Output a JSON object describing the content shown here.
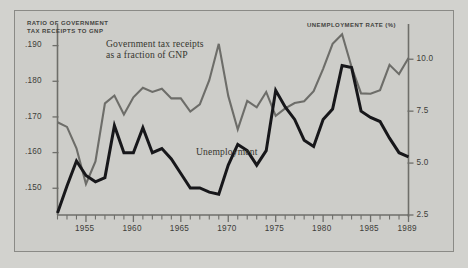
{
  "figure": {
    "background_color": "#cdcdc9",
    "left_axis_title": "RATIO OF GOVERNMENT\nTAX RECEIPTS TO GNP",
    "right_axis_title": "UNEMPLOYMENT RATE (%)",
    "series_label_tax": "Government tax receipts\nas a fraction of GNP",
    "series_label_unemployment": "Unemployment"
  },
  "chart_data": {
    "type": "line",
    "title": "",
    "xlabel": "",
    "ylabel": "RATIO OF GOVERNMENT TAX RECEIPTS TO GNP",
    "y2label": "UNEMPLOYMENT RATE (%)",
    "grid": false,
    "legend": "inline-annotations",
    "xlim": [
      1952,
      1989
    ],
    "ylim": [
      0.1425,
      0.1955
    ],
    "y2lim": [
      2.5,
      11.6
    ],
    "xticks": [
      1955,
      1960,
      1965,
      1970,
      1975,
      1980,
      1985,
      1989
    ],
    "xtick_labels": [
      "1955",
      "1960",
      "1965",
      "1970",
      "1975",
      "1980",
      "1985",
      "1989"
    ],
    "minor_xticks_interval": 1,
    "yticks": [
      0.15,
      0.16,
      0.17,
      0.18,
      0.19
    ],
    "ytick_labels": [
      ".150",
      ".160",
      ".170",
      ".180",
      ".190"
    ],
    "y2ticks": [
      2.5,
      5.0,
      7.5,
      10.0
    ],
    "y2tick_labels": [
      "2.5",
      "5.0",
      "7.5",
      "10.0"
    ],
    "x": [
      1952,
      1953,
      1954,
      1955,
      1956,
      1957,
      1958,
      1959,
      1960,
      1961,
      1962,
      1963,
      1964,
      1965,
      1966,
      1967,
      1968,
      1969,
      1970,
      1971,
      1972,
      1973,
      1974,
      1975,
      1976,
      1977,
      1978,
      1979,
      1980,
      1981,
      1982,
      1983,
      1984,
      1985,
      1986,
      1987,
      1988,
      1989
    ],
    "series": [
      {
        "name": "Government tax receipts as a fraction of GNP",
        "axis": "left",
        "color": "#6d6d69",
        "values": [
          0.1685,
          0.1672,
          0.1612,
          0.1512,
          0.1575,
          0.1738,
          0.176,
          0.1707,
          0.1755,
          0.1782,
          0.177,
          0.1779,
          0.1752,
          0.1752,
          0.1715,
          0.1735,
          0.1803,
          0.1905,
          0.1759,
          0.1665,
          0.1745,
          0.1727,
          0.177,
          0.1703,
          0.1724,
          0.1739,
          0.1744,
          0.1772,
          0.1835,
          0.1905,
          0.1932,
          0.184,
          0.1766,
          0.1765,
          0.1775,
          0.1846,
          0.182,
          0.1865
        ]
      },
      {
        "name": "Unemployment",
        "axis": "right",
        "color": "#17171a",
        "values": [
          2.6,
          3.9,
          5.1,
          4.4,
          4.1,
          4.3,
          6.8,
          5.5,
          5.5,
          6.7,
          5.5,
          5.7,
          5.2,
          4.5,
          3.8,
          3.8,
          3.6,
          3.5,
          4.9,
          5.9,
          5.6,
          4.9,
          5.6,
          8.5,
          7.7,
          7.1,
          6.1,
          5.8,
          7.1,
          7.6,
          9.7,
          9.6,
          7.5,
          7.2,
          7.0,
          6.2,
          5.5,
          5.3
        ]
      }
    ]
  }
}
